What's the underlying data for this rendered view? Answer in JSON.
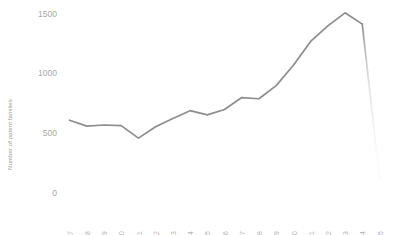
{
  "chart_data": {
    "type": "line",
    "title": "",
    "xlabel": "",
    "ylabel": "Number of patent families",
    "ylim": [
      0,
      1600
    ],
    "yticks": [
      0,
      500,
      1000,
      1500
    ],
    "ytick_labels": [
      "0",
      "500",
      "1000",
      "1500"
    ],
    "grid": false,
    "legend": null,
    "x": [
      "1997",
      "1998",
      "1999",
      "2000",
      "2001",
      "2002",
      "2003",
      "2004",
      "2005",
      "2006",
      "2007",
      "2008",
      "2009",
      "2010",
      "2011",
      "2012",
      "2013",
      "2014",
      "2015"
    ],
    "categories": [
      "1997",
      "1998",
      "1999",
      "2000",
      "2001",
      "2002",
      "2003",
      "2004",
      "2005",
      "2006",
      "2007",
      "2008",
      "2009",
      "2010",
      "2011",
      "2012",
      "2013",
      "2014",
      "2015"
    ],
    "values": [
      610,
      560,
      570,
      565,
      460,
      555,
      625,
      690,
      655,
      700,
      800,
      790,
      900,
      1070,
      1270,
      1400,
      1510,
      1415,
      120
    ],
    "series": [
      {
        "name": "Patent families",
        "values": [
          610,
          560,
          570,
          565,
          460,
          555,
          625,
          690,
          655,
          700,
          800,
          790,
          900,
          1070,
          1270,
          1400,
          1510,
          1415,
          120
        ]
      }
    ],
    "annotations": [
      {
        "text": "Final segment (2014-2015) rendered faded to indicate incomplete data",
        "from": "2014",
        "to": "2015"
      }
    ],
    "colors": {
      "line": "#8d8d8d",
      "line_faded": "#f2f2f2",
      "ytick": "#a8a8a8",
      "xtick": "#b4b4b4",
      "ylabel": "#9a9a9a",
      "background": "#ffffff"
    }
  }
}
